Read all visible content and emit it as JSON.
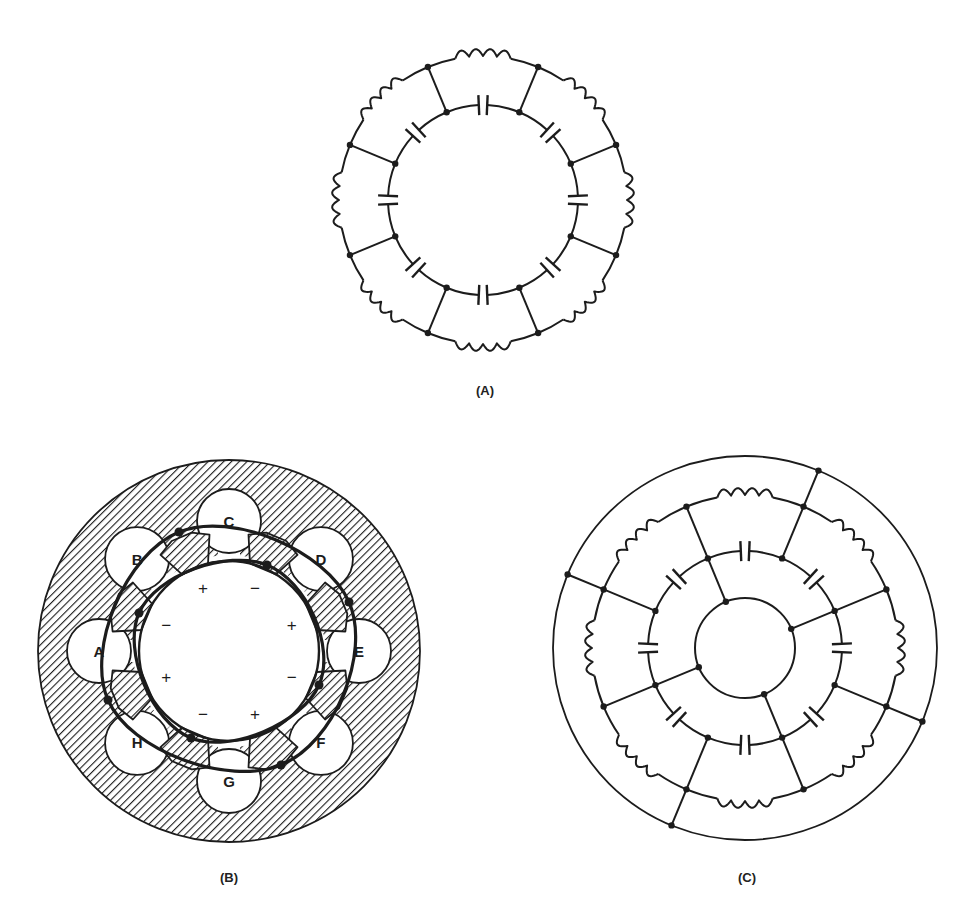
{
  "colors": {
    "ink": "#1c1c1c",
    "paper": "#ffffff"
  },
  "figures": [
    {
      "id": "A",
      "label": "(A)",
      "label_pos": [
        485,
        390
      ],
      "type": "ladder-ring",
      "center": [
        483,
        200
      ],
      "outer_ring": {
        "radius": 144,
        "element": "inductor",
        "count": 8
      },
      "inner_ring": {
        "radius": 95,
        "element": "capacitor",
        "count": 8
      },
      "spoke_angles_deg": [
        22.5,
        67.5,
        112.5,
        157.5,
        202.5,
        247.5,
        292.5,
        337.5
      ]
    },
    {
      "id": "B",
      "label": "(B)",
      "label_pos": [
        229,
        877
      ],
      "type": "cavity-magnetron-cross-section",
      "center": [
        229,
        651
      ],
      "outer_radius": 191,
      "bore_radius": 94,
      "slot_radius": 32,
      "slot_distance": 130,
      "slots": [
        {
          "label": "C",
          "angle_deg": 0
        },
        {
          "label": "D",
          "angle_deg": 45
        },
        {
          "label": "E",
          "angle_deg": 90
        },
        {
          "label": "F",
          "angle_deg": 135
        },
        {
          "label": "G",
          "angle_deg": 180
        },
        {
          "label": "H",
          "angle_deg": 225
        },
        {
          "label": "A",
          "angle_deg": 270
        },
        {
          "label": "B",
          "angle_deg": 315
        }
      ],
      "pole_tips": [
        {
          "angle_deg": 337.5,
          "sign": "+"
        },
        {
          "angle_deg": 22.5,
          "sign": "−"
        },
        {
          "angle_deg": 67.5,
          "sign": "+"
        },
        {
          "angle_deg": 112.5,
          "sign": "−"
        },
        {
          "angle_deg": 157.5,
          "sign": "+"
        },
        {
          "angle_deg": 202.5,
          "sign": "−"
        },
        {
          "angle_deg": 247.5,
          "sign": "+"
        },
        {
          "angle_deg": 292.5,
          "sign": "−"
        }
      ],
      "strap_loops": [
        {
          "name": "outer-strap",
          "points": [
            [
              179,
              532
            ],
            [
              349,
              602
            ],
            [
              281,
              765
            ],
            [
              108,
              700
            ]
          ]
        },
        {
          "name": "inner-strap",
          "points": [
            [
              267,
              565
            ],
            [
              319,
              685
            ],
            [
              191,
              738
            ],
            [
              139,
              613
            ]
          ]
        }
      ]
    },
    {
      "id": "C",
      "label": "(C)",
      "label_pos": [
        747,
        877
      ],
      "type": "ladder-ring-strapped",
      "center": [
        745,
        648
      ],
      "outer_circle": {
        "radius": 192
      },
      "inductor_ring": {
        "radius": 153,
        "element": "inductor",
        "count": 8
      },
      "capacitor_ring": {
        "radius": 97,
        "element": "capacitor",
        "count": 8
      },
      "inner_circle": {
        "radius": 50
      },
      "spoke_angles_deg": [
        22.5,
        67.5,
        112.5,
        157.5,
        202.5,
        247.5,
        292.5,
        337.5
      ],
      "outer_spoke_angles_deg": [
        22.5,
        112.5,
        202.5,
        292.5
      ],
      "inner_spoke_angles_deg": [
        337.5,
        67.5,
        157.5,
        247.5
      ]
    }
  ]
}
